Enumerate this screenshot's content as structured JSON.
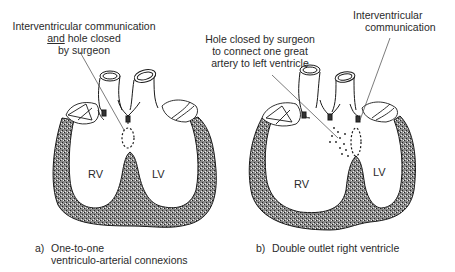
{
  "panel_a": {
    "annotation": {
      "line1": "Interventricular communication",
      "line2_underlined": "and",
      "line2_rest": " hole closed",
      "line3": "by surgeon"
    },
    "chambers": {
      "right": "RV",
      "left": "LV"
    },
    "caption": {
      "letter": "a)",
      "line1": "One-to-one",
      "line2": "ventriculo-arterial connexions"
    }
  },
  "panel_b": {
    "annotation_hole": {
      "line1": "Hole closed by surgeon",
      "line2": "to connect one great",
      "line3": "artery to left ventricle"
    },
    "annotation_vsd": {
      "line1": "Interventricular",
      "line2": "communication"
    },
    "chambers": {
      "right": "RV",
      "left": "LV"
    },
    "caption": {
      "letter": "b)",
      "line1": "Double outlet right ventricle"
    }
  },
  "colors": {
    "ink": "#1a1a1a",
    "myocardium_fill": "#6e6e6e",
    "background": "#ffffff"
  }
}
